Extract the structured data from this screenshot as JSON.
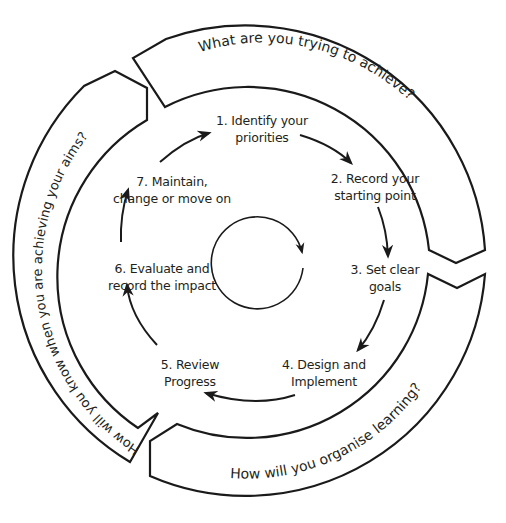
{
  "diagram": {
    "type": "cycle",
    "outer_ring": {
      "segments": [
        {
          "id": "top",
          "label": "What are you trying to achieve?"
        },
        {
          "id": "bottom",
          "label": "How will you organise learning?"
        },
        {
          "id": "left",
          "label": "How will you know when you are achieving your aims?"
        }
      ]
    },
    "steps": [
      {
        "number": 1,
        "line1": "1. Identify your",
        "line2": "priorities"
      },
      {
        "number": 2,
        "line1": "2. Record your",
        "line2": "starting point"
      },
      {
        "number": 3,
        "line1": "3. Set clear",
        "line2": "goals"
      },
      {
        "number": 4,
        "line1": "4. Design and",
        "line2": "Implement"
      },
      {
        "number": 5,
        "line1": "5. Review",
        "line2": "Progress"
      },
      {
        "number": 6,
        "line1": "6. Evaluate and",
        "line2": "record the impact"
      },
      {
        "number": 7,
        "line1": "7. Maintain,",
        "line2": "change or move on"
      }
    ],
    "center": {
      "icon": "clockwise-cycle-arrow-icon"
    },
    "colors": {
      "stroke": "#1a1a1a",
      "text": "#231f20",
      "background": "#ffffff"
    }
  }
}
